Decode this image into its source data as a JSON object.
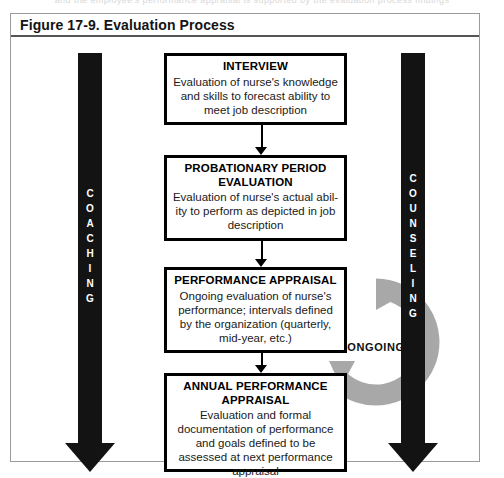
{
  "page": {
    "cut_off_header": "and the employee's performance appraisal is supported by the evaluation process findings"
  },
  "figure": {
    "title": "Figure 17-9. Evaluation Process"
  },
  "side_arrows": {
    "left": {
      "name": "coaching",
      "label": "COACHING",
      "letters": [
        "C",
        "O",
        "A",
        "C",
        "H",
        "I",
        "N",
        "G"
      ],
      "color": "#131313",
      "text_color": "#ffffff"
    },
    "right": {
      "name": "counseling",
      "label": "COUNSELING",
      "letters": [
        "C",
        "O",
        "U",
        "N",
        "S",
        "E",
        "L",
        "I",
        "N",
        "G"
      ],
      "color": "#131313",
      "text_color": "#ffffff"
    }
  },
  "ongoing": {
    "label": "ONGOING",
    "icon": "circular-arrow-icon",
    "color": "#a8a8a8"
  },
  "process_steps": [
    {
      "id": "interview",
      "title": "INTERVIEW",
      "body": "Evaluation of nurse's knowledge and skills to forecast ability to meet job description"
    },
    {
      "id": "probationary-period-evaluation",
      "title": "PROBATIONARY PERIOD EVALUATION",
      "body": "Evaluation of nurse's actual abil-ity to perform as depicted in job description"
    },
    {
      "id": "performance-appraisal",
      "title": "PERFORMANCE APPRAISAL",
      "body": "Ongoing evaluation of nurse's performance; intervals defined by the organization (quarterly, mid-year, etc.)"
    },
    {
      "id": "annual-performance-appraisal",
      "title": "ANNUAL PERFORMANCE APPRAISAL",
      "body": "Evaluation and formal documentation of performance and goals defined to be assessed at next performance appraisal"
    }
  ],
  "connectors": [
    {
      "from": "interview",
      "to": "probationary-period-evaluation",
      "type": "arrow-down"
    },
    {
      "from": "probationary-period-evaluation",
      "to": "performance-appraisal",
      "type": "arrow-down"
    },
    {
      "from": "performance-appraisal",
      "to": "annual-performance-appraisal",
      "type": "arrow-down"
    }
  ]
}
